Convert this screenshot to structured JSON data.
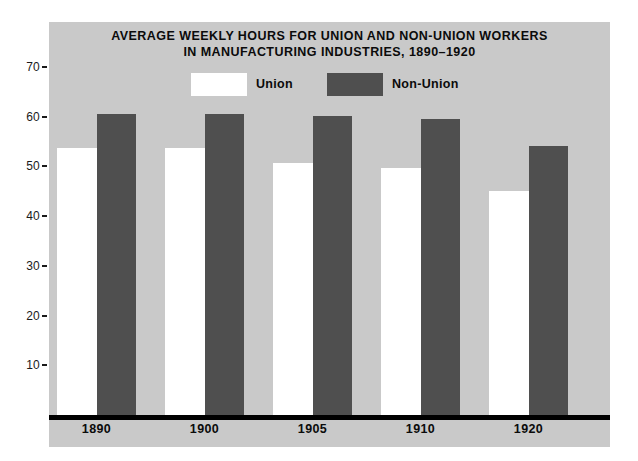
{
  "chart_data": {
    "type": "bar",
    "title": "AVERAGE WEEKLY HOURS FOR UNION AND NON-UNION WORKERS IN MANUFACTURING INDUSTRIES, 1890–1920",
    "title_lines": [
      "AVERAGE WEEKLY HOURS FOR UNION AND NON-UNION WORKERS",
      "IN MANUFACTURING INDUSTRIES, 1890–1920"
    ],
    "xlabel": "",
    "ylabel": "",
    "categories": [
      "1890",
      "1900",
      "1905",
      "1910",
      "1920"
    ],
    "series": [
      {
        "name": "Union",
        "color": "#ffffff",
        "values": [
          54,
          54,
          51,
          50,
          45.5
        ]
      },
      {
        "name": "Non-Union",
        "color": "#4f4f4f",
        "values": [
          61,
          61,
          60.5,
          60,
          54.5
        ]
      }
    ],
    "ylim": [
      0,
      79
    ],
    "yticks": [
      10,
      20,
      30,
      40,
      50,
      60,
      70
    ],
    "ytick_labels": [
      "10",
      "20",
      "30",
      "40",
      "50",
      "60",
      "70"
    ],
    "grid": false,
    "legend_position": "top-center",
    "legend_entries": [
      "Union",
      "Non-Union"
    ],
    "panel_color": "#c9c9c9",
    "axis_color": "#000000"
  }
}
